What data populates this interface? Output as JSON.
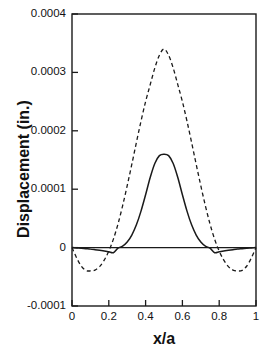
{
  "chart_data": {
    "type": "line",
    "title": "",
    "xlabel": "x/a",
    "ylabel": "Displacement (in.)",
    "xlim": [
      0,
      1
    ],
    "ylim": [
      -0.0001,
      0.0004
    ],
    "grid": false,
    "legend": "none",
    "xticks": [
      "0",
      "0.2",
      "0.4",
      "0.6",
      "0.8",
      "1"
    ],
    "xtick_values": [
      0,
      0.2,
      0.4,
      0.6,
      0.8,
      1
    ],
    "yticks": [
      "0.0004",
      "0.0003",
      "0.0002",
      "0.0001",
      "0",
      "-0.0001"
    ],
    "ytick_values": [
      0.0004,
      0.0003,
      0.0002,
      0.0001,
      0,
      -0.0001
    ],
    "zero_line": 0,
    "series": [
      {
        "name": "solid-curve",
        "style": "solid",
        "color": "#1a1a1a",
        "peak_x": 0.5,
        "peak_y": 0.00016,
        "min_y": -1e-05,
        "x": [
          0.0,
          0.025,
          0.05,
          0.075,
          0.1,
          0.125,
          0.15,
          0.175,
          0.2,
          0.225,
          0.25,
          0.275,
          0.3,
          0.325,
          0.35,
          0.375,
          0.4,
          0.425,
          0.45,
          0.475,
          0.5,
          0.525,
          0.55,
          0.575,
          0.6,
          0.625,
          0.65,
          0.675,
          0.7,
          0.725,
          0.75,
          0.775,
          0.8,
          0.825,
          0.85,
          0.875,
          0.9,
          0.925,
          0.95,
          0.975,
          1.0
        ],
        "values": [
          0.0,
          -5e-07,
          -1e-06,
          -1.8e-06,
          -2.6e-06,
          -3.6e-06,
          -4.7e-06,
          -5.8e-06,
          -7.2e-06,
          -8.7e-06,
          -1e-06,
          2.5e-06,
          9.5e-06,
          2.15e-05,
          3.9e-05,
          6.25e-05,
          9.05e-05,
          0.00012,
          0.000144,
          0.0001575,
          0.00016,
          0.0001575,
          0.000144,
          0.00012,
          9.05e-05,
          6.25e-05,
          3.9e-05,
          2.15e-05,
          9.5e-06,
          2.5e-06,
          -1e-06,
          -8.7e-06,
          -7.2e-06,
          -5.8e-06,
          -4.7e-06,
          -3.6e-06,
          -2.6e-06,
          -1.8e-06,
          -1e-06,
          -5e-07,
          0.0
        ]
      },
      {
        "name": "dashed-curve",
        "style": "dashed",
        "color": "#1a1a1a",
        "peak_x": 0.5,
        "peak_y": 0.00034,
        "min_y": -4e-05,
        "x": [
          0.0,
          0.025,
          0.05,
          0.075,
          0.1,
          0.125,
          0.15,
          0.175,
          0.2,
          0.225,
          0.25,
          0.275,
          0.3,
          0.325,
          0.35,
          0.375,
          0.4,
          0.425,
          0.45,
          0.475,
          0.5,
          0.525,
          0.55,
          0.575,
          0.6,
          0.625,
          0.65,
          0.675,
          0.7,
          0.725,
          0.75,
          0.775,
          0.8,
          0.825,
          0.85,
          0.875,
          0.9,
          0.925,
          0.95,
          0.975,
          1.0
        ],
        "values": [
          0.0,
          -1.75e-05,
          -3.15e-05,
          -3.9e-05,
          -4e-05,
          -3.85e-05,
          -3.25e-05,
          -2.15e-05,
          -6e-06,
          1.45e-05,
          4.05e-05,
          7.15e-05,
          0.000106,
          0.0001425,
          0.00018,
          0.0002165,
          0.00025,
          0.000279,
          0.0003075,
          0.0003295,
          0.00034,
          0.0003295,
          0.0003075,
          0.000279,
          0.00025,
          0.0002165,
          0.00018,
          0.0001425,
          0.000106,
          7.15e-05,
          4.05e-05,
          1.45e-05,
          -6e-06,
          -2.15e-05,
          -3.25e-05,
          -3.85e-05,
          -4e-05,
          -3.9e-05,
          -3.15e-05,
          -1.75e-05,
          0.0
        ]
      }
    ]
  }
}
